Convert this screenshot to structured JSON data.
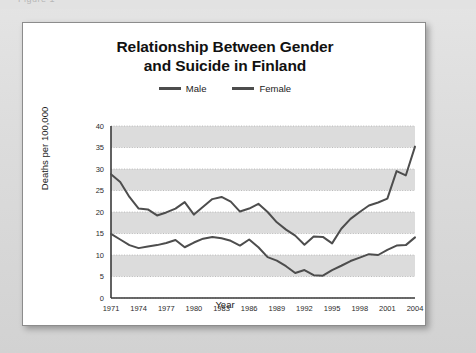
{
  "page": {
    "background_color": "#dcdcdc",
    "cut_off_header_text": "Figure 1"
  },
  "card": {
    "background_color": "#ffffff",
    "border_color": "#8c8c8c"
  },
  "chart_data": {
    "type": "line",
    "title_line1": "Relationship Between Gender",
    "title_line2": "and Suicide in Finland",
    "title": "Relationship Between Gender and Suicide in Finland",
    "xlabel": "Year",
    "ylabel": "Deaths per 100,000",
    "xlim": [
      1971,
      2004
    ],
    "ylim": [
      0,
      40
    ],
    "ytick_step": 5,
    "yticks": [
      0,
      5,
      10,
      15,
      20,
      25,
      30,
      35,
      40
    ],
    "xticks": [
      1971,
      1974,
      1977,
      1980,
      1983,
      1986,
      1989,
      1992,
      1995,
      1998,
      2001,
      2004
    ],
    "x": [
      1971,
      1972,
      1973,
      1974,
      1975,
      1976,
      1977,
      1978,
      1979,
      1980,
      1981,
      1982,
      1983,
      1984,
      1985,
      1986,
      1987,
      1988,
      1989,
      1990,
      1991,
      1992,
      1993,
      1994,
      1995,
      1996,
      1997,
      1998,
      1999,
      2000,
      2001,
      2002,
      2003,
      2004
    ],
    "grid": "horizontal-bands",
    "grid_band_color": "#dcdcdc",
    "legend_position": "top-center",
    "series": [
      {
        "name": "Male",
        "color": "#4d4d4d",
        "values": [
          28.8,
          27.0,
          23.5,
          20.8,
          20.6,
          19.2,
          19.9,
          20.8,
          22.3,
          19.4,
          21.2,
          23.0,
          23.5,
          22.4,
          20.1,
          20.8,
          21.9,
          20.0,
          17.6,
          15.9,
          14.5,
          12.4,
          14.3,
          14.2,
          12.7,
          16.1,
          18.4,
          20.0,
          21.5,
          22.2,
          23.1,
          29.5,
          28.5,
          35.2
        ]
      },
      {
        "name": "Female",
        "color": "#4d4d4d",
        "values": [
          14.9,
          13.6,
          12.3,
          11.6,
          12.0,
          12.3,
          12.8,
          13.5,
          11.8,
          12.9,
          13.8,
          14.2,
          13.9,
          13.3,
          12.2,
          13.6,
          11.8,
          9.5,
          8.7,
          7.4,
          5.8,
          6.5,
          5.3,
          5.2,
          6.5,
          7.5,
          8.6,
          9.4,
          10.2,
          10.0,
          11.2,
          12.2,
          12.3,
          14.1
        ]
      }
    ]
  },
  "legend": {
    "items": [
      {
        "label": "Male",
        "color": "#4d4d4d"
      },
      {
        "label": "Female",
        "color": "#4d4d4d"
      }
    ]
  }
}
